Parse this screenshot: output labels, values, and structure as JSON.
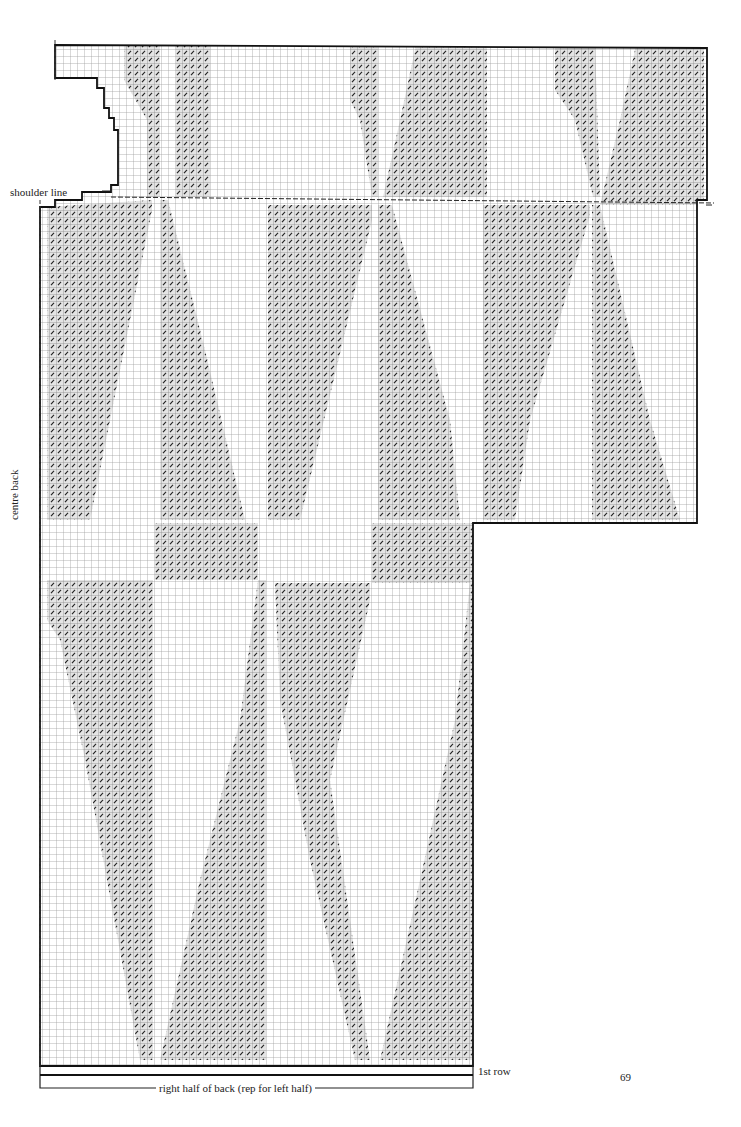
{
  "page": {
    "page_number": "69",
    "labels": {
      "shoulder_line": "shoulder line",
      "centre_back": "centre back",
      "first_row": "1st row",
      "bottom_caption": "right half of back (rep for left half)"
    }
  },
  "chart_data": {
    "type": "knitting-chart",
    "title": "right half of back (rep for left half)",
    "cell_size_px": 7,
    "symbol": "diagonal slash (contrast colour stitch)",
    "colors": {
      "grid": "#9a9a9a",
      "outline": "#111111",
      "slash": "#333333",
      "shade": "#d8d8d8"
    },
    "sections": [
      {
        "name": "yoke-above-shoulder",
        "bounds": [
          55,
          45,
          707,
          197
        ]
      },
      {
        "name": "upper-body-and-sleeve",
        "bounds": [
          47,
          197,
          697,
          523
        ]
      },
      {
        "name": "lower-body",
        "bounds": [
          40,
          523,
          473,
          1066
        ]
      }
    ],
    "neck_steps": [
      [
        55,
        78
      ],
      [
        97,
        78
      ],
      [
        97,
        88
      ],
      [
        104,
        88
      ],
      [
        104,
        108
      ],
      [
        109,
        108
      ],
      [
        109,
        118
      ],
      [
        114,
        118
      ],
      [
        114,
        130
      ],
      [
        118,
        130
      ],
      [
        118,
        185
      ],
      [
        111,
        185
      ],
      [
        111,
        192
      ],
      [
        82,
        192
      ],
      [
        82,
        200
      ],
      [
        55,
        200
      ],
      [
        55,
        207
      ],
      [
        47,
        207
      ]
    ],
    "motifs": [
      {
        "name": "yoke-band-1",
        "points": [
          [
            124,
            45
          ],
          [
            160,
            45
          ],
          [
            160,
            197
          ],
          [
            147,
            197
          ],
          [
            147,
            120
          ],
          [
            124,
            80
          ]
        ]
      },
      {
        "name": "yoke-band-2",
        "points": [
          [
            176,
            45
          ],
          [
            210,
            45
          ],
          [
            210,
            197
          ],
          [
            176,
            197
          ],
          [
            176,
            120
          ]
        ]
      },
      {
        "name": "yoke-band-3",
        "points": [
          [
            350,
            45
          ],
          [
            378,
            45
          ],
          [
            378,
            197
          ],
          [
            372,
            197
          ],
          [
            360,
            120
          ],
          [
            350,
            100
          ]
        ]
      },
      {
        "name": "yoke-band-4",
        "points": [
          [
            416,
            45
          ],
          [
            487,
            45
          ],
          [
            487,
            197
          ],
          [
            383,
            197
          ],
          [
            400,
            120
          ]
        ]
      },
      {
        "name": "yoke-band-5",
        "points": [
          [
            555,
            45
          ],
          [
            595,
            45
          ],
          [
            600,
            197
          ],
          [
            593,
            197
          ],
          [
            575,
            120
          ],
          [
            555,
            90
          ]
        ]
      },
      {
        "name": "yoke-band-6",
        "points": [
          [
            636,
            45
          ],
          [
            704,
            45
          ],
          [
            704,
            205
          ],
          [
            600,
            205
          ],
          [
            620,
            120
          ]
        ]
      },
      {
        "name": "body-band-A",
        "points": [
          [
            47,
            207
          ],
          [
            152,
            200
          ],
          [
            152,
            210
          ],
          [
            120,
            370
          ],
          [
            90,
            520
          ],
          [
            47,
            520
          ]
        ]
      },
      {
        "name": "body-band-B",
        "points": [
          [
            160,
            200
          ],
          [
            168,
            200
          ],
          [
            205,
            350
          ],
          [
            245,
            520
          ],
          [
            160,
            520
          ]
        ]
      },
      {
        "name": "body-band-C",
        "points": [
          [
            268,
            205
          ],
          [
            372,
            205
          ],
          [
            372,
            220
          ],
          [
            300,
            520
          ],
          [
            268,
            520
          ]
        ]
      },
      {
        "name": "body-band-D",
        "points": [
          [
            378,
            205
          ],
          [
            392,
            205
          ],
          [
            450,
            420
          ],
          [
            460,
            520
          ],
          [
            378,
            520
          ]
        ]
      },
      {
        "name": "body-band-E",
        "points": [
          [
            483,
            205
          ],
          [
            590,
            205
          ],
          [
            590,
            215
          ],
          [
            530,
            420
          ],
          [
            515,
            520
          ],
          [
            483,
            520
          ]
        ]
      },
      {
        "name": "body-band-F",
        "points": [
          [
            592,
            205
          ],
          [
            600,
            205
          ],
          [
            650,
            420
          ],
          [
            680,
            520
          ],
          [
            592,
            520
          ]
        ]
      },
      {
        "name": "lower-band-A",
        "points": [
          [
            47,
            580
          ],
          [
            153,
            580
          ],
          [
            153,
            1060
          ],
          [
            140,
            1060
          ],
          [
            85,
            760
          ],
          [
            60,
            640
          ],
          [
            47,
            620
          ]
        ]
      },
      {
        "name": "lower-band-B",
        "points": [
          [
            258,
            580
          ],
          [
            266,
            580
          ],
          [
            266,
            1060
          ],
          [
            160,
            1060
          ],
          [
            200,
            880
          ],
          [
            240,
            720
          ]
        ]
      },
      {
        "name": "lower-band-C",
        "points": [
          [
            275,
            583
          ],
          [
            370,
            583
          ],
          [
            370,
            600
          ],
          [
            330,
            780
          ],
          [
            370,
            1060
          ],
          [
            355,
            1060
          ],
          [
            310,
            860
          ],
          [
            280,
            700
          ]
        ]
      },
      {
        "name": "lower-band-D",
        "points": [
          [
            470,
            583
          ],
          [
            473,
            583
          ],
          [
            473,
            1060
          ],
          [
            380,
            1060
          ],
          [
            420,
            880
          ],
          [
            455,
            720
          ]
        ]
      },
      {
        "name": "upper-strip-1",
        "points": [
          [
            155,
            523
          ],
          [
            258,
            523
          ],
          [
            258,
            580
          ],
          [
            155,
            580
          ]
        ]
      },
      {
        "name": "upper-strip-2",
        "points": [
          [
            372,
            523
          ],
          [
            473,
            523
          ],
          [
            473,
            583
          ],
          [
            372,
            583
          ]
        ]
      }
    ]
  }
}
